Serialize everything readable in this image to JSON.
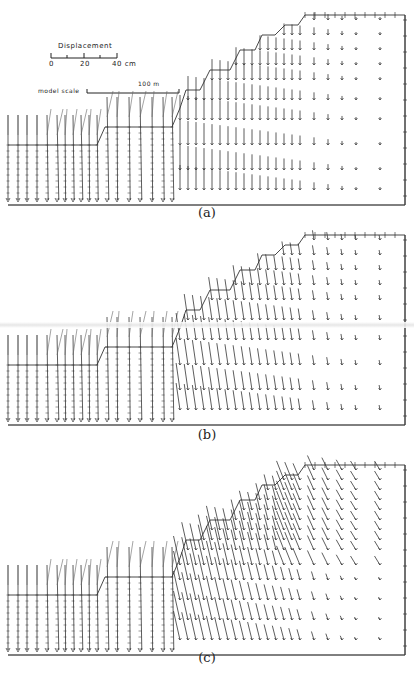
{
  "figure": {
    "legend": {
      "displacement_title": "Displacement",
      "displacement_ticks": [
        "0",
        "20",
        "40 cm"
      ],
      "model_scale_label": "model scale",
      "model_scale_value": "100 m"
    },
    "panels": [
      {
        "id": "a",
        "caption": "(a)",
        "description": "displacement vectors, stage (a)"
      },
      {
        "id": "b",
        "caption": "(b)",
        "description": "displacement vectors, stage (b)"
      },
      {
        "id": "c",
        "caption": "(c)",
        "description": "displacement vectors, stage (c)"
      }
    ],
    "colors": {
      "line": "#222222",
      "background": "#ffffff"
    }
  }
}
